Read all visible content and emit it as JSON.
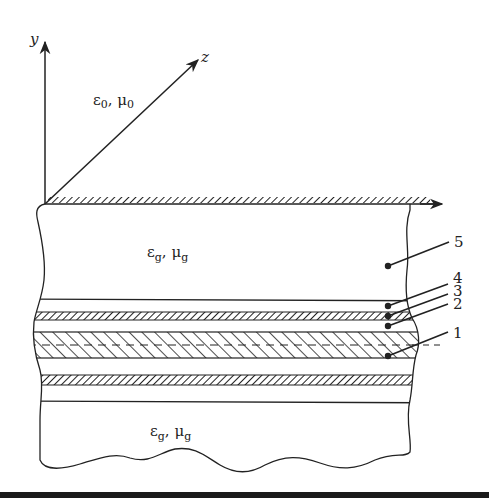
{
  "diagram": {
    "type": "layered-waveguide-cross-section",
    "axes": {
      "y_label": "y",
      "z_label": "z"
    },
    "regions": {
      "upper_medium": {
        "eps": "ε",
        "eps_sub": "0",
        "mu": "μ",
        "mu_sub": "0",
        "sep": ", "
      },
      "cladding_top": {
        "eps": "ε",
        "eps_sub": "g",
        "mu": "μ",
        "mu_sub": "g",
        "sep": ", "
      },
      "cladding_bottom": {
        "eps": "ε",
        "eps_sub": "g",
        "mu": "μ",
        "mu_sub": "g",
        "sep": ", "
      }
    },
    "layer_labels": [
      "1",
      "2",
      "3",
      "4",
      "5"
    ],
    "colors": {
      "line": "#222222",
      "background": "#ffffff",
      "bottom_bar": "#1a1a1a"
    }
  }
}
